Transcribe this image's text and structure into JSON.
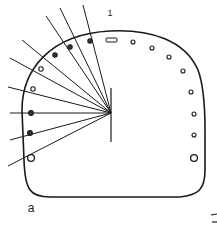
{
  "figure": {
    "panel_label": "a",
    "top_marker_label": "1",
    "colors": {
      "stroke": "#1a1a1a",
      "background": "#ffffff"
    }
  },
  "diagram": {
    "outline": "rounded dome-shaped enclosure",
    "center_point": {
      "x": 111,
      "y": 113
    },
    "vertical_line": {
      "x": 111,
      "y1": 88,
      "y2": 142
    },
    "rays": [
      {
        "x2": 46,
        "y2": 16
      },
      {
        "x2": 10,
        "y2": 58
      },
      {
        "x2": 8,
        "y2": 87
      },
      {
        "x2": 10,
        "y2": 113
      },
      {
        "x2": 10,
        "y2": 140
      },
      {
        "x2": 8,
        "y2": 166
      },
      {
        "x2": 22,
        "y2": 40
      },
      {
        "x2": 60,
        "y2": 8
      },
      {
        "x2": 83,
        "y2": 5
      }
    ],
    "left_markers": [
      {
        "x": 90,
        "y": 41,
        "r": 2.2,
        "fill": "dark"
      },
      {
        "x": 70,
        "y": 47,
        "r": 2.2,
        "fill": "dark"
      },
      {
        "x": 55,
        "y": 55,
        "r": 2.2,
        "fill": "dark"
      },
      {
        "x": 41,
        "y": 69,
        "r": 2.2,
        "fill": "hollow"
      },
      {
        "x": 33,
        "y": 89,
        "r": 2.2,
        "fill": "hollow"
      },
      {
        "x": 31,
        "y": 113,
        "r": 2.4,
        "fill": "dark"
      },
      {
        "x": 30,
        "y": 133,
        "r": 2.4,
        "fill": "dark"
      },
      {
        "x": 31,
        "y": 158,
        "r": 3.4,
        "fill": "hollow"
      }
    ],
    "top_rect_marker": {
      "x": 106,
      "y": 38,
      "w": 11,
      "h": 4
    },
    "right_markers": [
      {
        "x": 133,
        "y": 42,
        "r": 2
      },
      {
        "x": 152,
        "y": 48,
        "r": 2
      },
      {
        "x": 169,
        "y": 57,
        "r": 2
      },
      {
        "x": 183,
        "y": 71,
        "r": 2
      },
      {
        "x": 191,
        "y": 92,
        "r": 2
      },
      {
        "x": 194,
        "y": 114,
        "r": 2
      },
      {
        "x": 194,
        "y": 135,
        "r": 2
      },
      {
        "x": 194,
        "y": 158,
        "r": 3.4
      }
    ]
  }
}
